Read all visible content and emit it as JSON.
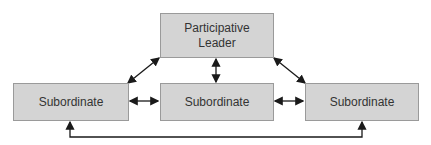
{
  "diagram": {
    "leader": {
      "label_line1": "Participative",
      "label_line2": "Leader"
    },
    "subordinates": [
      {
        "label": "Subordinate"
      },
      {
        "label": "Subordinate"
      },
      {
        "label": "Subordinate"
      }
    ],
    "colors": {
      "box_fill": "#d4d4d4",
      "box_border": "#9a9a9a",
      "arrow": "#1a1a1a"
    }
  }
}
